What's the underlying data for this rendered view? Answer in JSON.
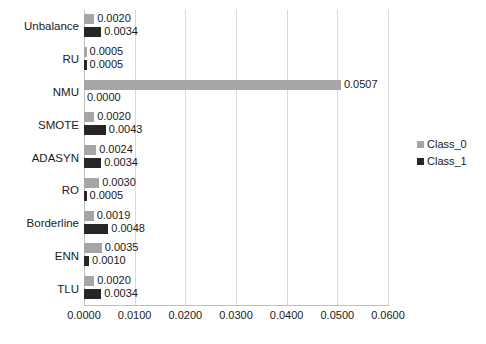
{
  "chart_data": {
    "type": "bar",
    "orientation": "horizontal",
    "title": "",
    "xlabel": "",
    "ylabel": "",
    "categories": [
      "Unbalance",
      "RU",
      "NMU",
      "SMOTE",
      "ADASYN",
      "RO",
      "Borderline",
      "ENN",
      "TLU"
    ],
    "series": [
      {
        "name": "Class_0",
        "color": "#a6a6a6",
        "values": [
          0.002,
          0.0005,
          0.0507,
          0.002,
          0.0024,
          0.003,
          0.0019,
          0.0035,
          0.002
        ],
        "labels": [
          "0.0020",
          "0.0005",
          "0.0507",
          "0.0020",
          "0.0024",
          "0.0030",
          "0.0019",
          "0.0035",
          "0.0020"
        ]
      },
      {
        "name": "Class_1",
        "color": "#262626",
        "values": [
          0.0034,
          0.0005,
          0.0,
          0.0043,
          0.0034,
          0.0005,
          0.0048,
          0.001,
          0.0034
        ],
        "labels": [
          "0.0034",
          "0.0005",
          "0.0000",
          "0.0043",
          "0.0034",
          "0.0005",
          "0.0048",
          "0.0010",
          "0.0034"
        ]
      }
    ],
    "xlim": [
      0.0,
      0.06
    ],
    "xticks": [
      0.0,
      0.01,
      0.02,
      0.03,
      0.04,
      0.05,
      0.06
    ],
    "xtick_labels": [
      "0.0000",
      "0.0100",
      "0.0200",
      "0.0300",
      "0.0400",
      "0.0500",
      "0.0600"
    ],
    "grid": true,
    "grid_axis": "x",
    "legend_position": "right",
    "legend_entries": [
      "Class_0",
      "Class_1"
    ],
    "data_labels": true
  },
  "colors": {
    "series_0": "#a6a6a6",
    "series_1": "#262626",
    "gridline": "#d9d9d9",
    "axis": "#bfbfbf",
    "background": "#ffffff",
    "text": "#1a1a1a"
  }
}
